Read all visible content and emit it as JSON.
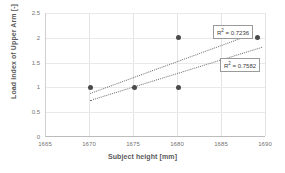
{
  "chart_data": {
    "type": "scatter",
    "title": "",
    "xlabel": "Subject height [mm]",
    "ylabel": "Load index of Upper Arm [-]",
    "xlim": [
      1665,
      1690
    ],
    "ylim": [
      0,
      2.5
    ],
    "xticks": [
      "1665",
      "1670",
      "1675",
      "1680",
      "1685",
      "1690"
    ],
    "xtick_values": [
      1665,
      1670,
      1675,
      1680,
      1685,
      1690
    ],
    "yticks": [
      "0",
      "0.5",
      "1",
      "1.5",
      "2",
      "2.5"
    ],
    "ytick_values": [
      0,
      0.5,
      1,
      1.5,
      2,
      2.5
    ],
    "grid": true,
    "legend": "none",
    "points": [
      {
        "x": 1670,
        "y": 1
      },
      {
        "x": 1675,
        "y": 1
      },
      {
        "x": 1680,
        "y": 2
      },
      {
        "x": 1680,
        "y": 1
      },
      {
        "x": 1689,
        "y": 2
      }
    ],
    "trendlines": [
      {
        "name": "upper-trendline",
        "x0": 1670,
        "y0": 0.89,
        "x1": 1688.5,
        "y1": 2.09,
        "style": "dotted"
      },
      {
        "name": "lower-trendline",
        "x0": 1670,
        "y0": 0.75,
        "x1": 1689.5,
        "y1": 1.82,
        "style": "dotted"
      }
    ],
    "annotations": [
      {
        "name": "r2-upper",
        "prefix": "R",
        "sup": "2",
        "text": " = 0.7236",
        "value": 0.7236
      },
      {
        "name": "r2-lower",
        "prefix": "R",
        "sup": "2",
        "text": " = 0.7582",
        "value": 0.7582
      }
    ],
    "colors": {
      "marker": "#4a4a4a",
      "trendline": "#6f6f6f",
      "grid": "#e4e4e4",
      "axis": "#bcbcbc",
      "text": "#5a5a5a",
      "background": "#ffffff"
    }
  }
}
